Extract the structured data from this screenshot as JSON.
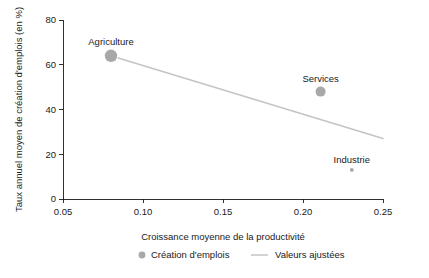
{
  "chart_data": {
    "type": "scatter",
    "title": "",
    "xlabel": "Croissance moyenne de la productivité",
    "ylabel": "Taux annuel moyen de création d'emplois (en %)",
    "xlim": [
      0.035,
      0.255
    ],
    "ylim": [
      -4,
      82
    ],
    "xticks": [
      0.05,
      0.1,
      0.15,
      0.2,
      0.25
    ],
    "xticklabels": [
      "0.05",
      "0.10",
      "0.15",
      "0.20",
      "0.25"
    ],
    "yticks": [
      0,
      20,
      40,
      60,
      80
    ],
    "yticklabels": [
      "0",
      "20",
      "40",
      "60",
      "80"
    ],
    "grid": false,
    "legend_position": "bottom",
    "points": [
      {
        "label": "Agriculture",
        "x": 0.08,
        "y": 64,
        "size": 6.2,
        "color": "#a8a8a8"
      },
      {
        "label": "Services",
        "x": 0.211,
        "y": 48,
        "size": 5.0,
        "color": "#a8a8a8"
      },
      {
        "label": "Industrie",
        "x": 0.2305,
        "y": 13,
        "size": 1.9,
        "color": "#a8a8a8"
      }
    ],
    "fit_line": {
      "name": "Valeurs ajustées",
      "x": [
        0.0845,
        0.25
      ],
      "y": [
        63.0,
        27.0
      ],
      "color": "#c4c4c4"
    },
    "legend": [
      {
        "label": "Création d'emplois",
        "marker": "circle",
        "color": "#a8a8a8"
      },
      {
        "label": "Valeurs ajustées",
        "marker": "line",
        "color": "#c4c4c4"
      }
    ]
  }
}
